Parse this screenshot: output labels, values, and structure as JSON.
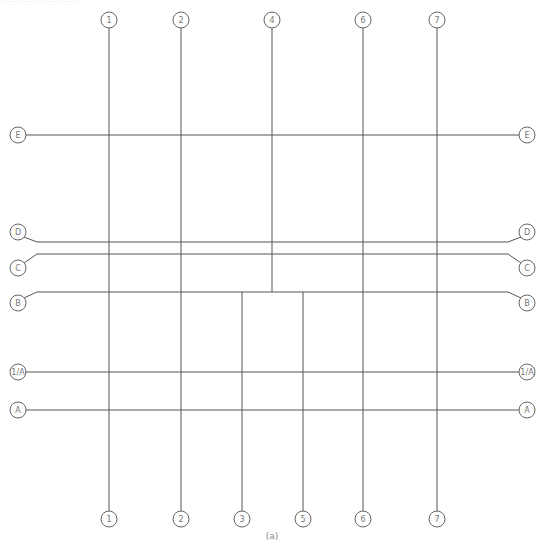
{
  "header_text_cut": "……………………",
  "caption": "(a)",
  "colors": {
    "line": "#555555",
    "bubble_stroke": "#666666",
    "label": "#777777"
  },
  "vertical_axes": [
    {
      "label": "1",
      "x": 109,
      "y1": 28,
      "y2": 511,
      "top_bubble": true,
      "bottom_bubble": true
    },
    {
      "label": "2",
      "x": 181,
      "y1": 28,
      "y2": 511,
      "top_bubble": true,
      "bottom_bubble": true
    },
    {
      "label": "4",
      "x": 272,
      "y1": 28,
      "y2": 292,
      "top_bubble": true,
      "bottom_bubble": false
    },
    {
      "label": "3",
      "x": 242,
      "y1": 292,
      "y2": 511,
      "top_bubble": false,
      "bottom_bubble": true
    },
    {
      "label": "5",
      "x": 303,
      "y1": 292,
      "y2": 511,
      "top_bubble": false,
      "bottom_bubble": true
    },
    {
      "label": "6",
      "x": 363,
      "y1": 28,
      "y2": 511,
      "top_bubble": true,
      "bottom_bubble": true
    },
    {
      "label": "7",
      "x": 437,
      "y1": 28,
      "y2": 511,
      "top_bubble": true,
      "bottom_bubble": true
    }
  ],
  "horizontal_axes": [
    {
      "label": "E",
      "y": 135,
      "bubble_y": 135
    },
    {
      "label": "D",
      "y": 242,
      "bubble_y": 232
    },
    {
      "label": "C",
      "y": 254,
      "bubble_y": 268
    },
    {
      "label": "B",
      "y": 292,
      "bubble_y": 303
    },
    {
      "label": "1/A",
      "y": 372,
      "bubble_y": 372
    },
    {
      "label": "A",
      "y": 410,
      "bubble_y": 410
    }
  ],
  "horizontal_partial": [
    {
      "label": "B-segment",
      "y": 292,
      "x1": 37,
      "x2": 510
    }
  ],
  "layout": {
    "left_bubble_x": 18,
    "right_bubble_x": 527,
    "line_x1": 37,
    "line_x2": 508,
    "top_bubble_y": 20,
    "bottom_bubble_y": 519,
    "bubble_r": 8
  }
}
